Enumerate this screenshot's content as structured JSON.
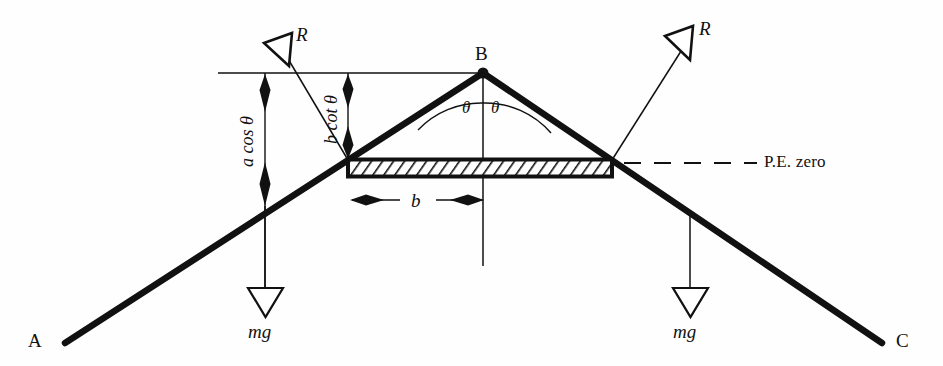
{
  "figure": {
    "type": "physics-free-body-diagram",
    "background_color": "#fefefe",
    "line_color": "#111111"
  },
  "vertices": {
    "left_label": "A",
    "apex_label": "B",
    "right_label": "C"
  },
  "angles": {
    "left_label": "θ",
    "right_label": "θ"
  },
  "forces": {
    "reaction_left_label": "R",
    "reaction_right_label": "R",
    "weight_left_label": "mg",
    "weight_right_label": "mg"
  },
  "dimensions": {
    "height_a_label": "a cos θ",
    "height_b_label": "b cot θ",
    "width_label": "b"
  },
  "datum": {
    "label": "P.E. zero",
    "line_style": "dashed"
  }
}
